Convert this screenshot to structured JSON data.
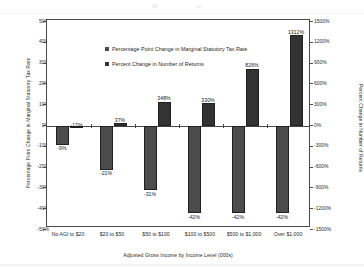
{
  "chart_data": {
    "type": "bar",
    "title": "",
    "xlabel": "Adjusted Gross Income by Income Level (000s)",
    "ylabel": "Percentage Point Change in Marginal Statutory Tax Rate",
    "ylabel_secondary": "Percent Change in Number of Returns",
    "categories": [
      "No AGI to $20",
      "$20 to $50",
      "$50 to $100",
      "$100 to $500",
      "$500 to $1,000",
      "Over $1,000"
    ],
    "series": [
      {
        "name": "Percentage Point Change in Marginal Statutory Tax Rate",
        "axis": "left",
        "color": "#4c4c4c",
        "unit": "%",
        "values": [
          -9,
          -21,
          -31,
          -42,
          -42,
          -42
        ],
        "labels": [
          "-9%",
          "-21%",
          "-31%",
          "-42%",
          "-42%",
          "-42%"
        ]
      },
      {
        "name": "Percent Change in Number of Returns",
        "axis": "right",
        "color": "#333333",
        "unit": "%",
        "values": [
          -17,
          37,
          348,
          330,
          826,
          1312
        ],
        "labels": [
          "-17%",
          "37%",
          "348%",
          "330%",
          "826%",
          "1312%"
        ]
      }
    ],
    "ylim": [
      -50,
      50
    ],
    "ylim_secondary": [
      -1500,
      1500
    ],
    "ytick_step": 10,
    "ytick_step_secondary": 300,
    "yticks_left": [
      "50%",
      "40%",
      "30%",
      "20%",
      "10%",
      "0%",
      "-10%",
      "-20%",
      "-30%",
      "-40%",
      "-50%"
    ],
    "yticks_right": [
      "1500%",
      "1200%",
      "900%",
      "600%",
      "300%",
      "0%",
      "-300%",
      "-600%",
      "-900%",
      "-1200%",
      "-1500%"
    ],
    "grid": false,
    "legend_position": "top-left",
    "legend": [
      "Percentage Point Change in Marginal Statutory Tax Rate",
      "Percent Change in Number of Returns"
    ]
  }
}
